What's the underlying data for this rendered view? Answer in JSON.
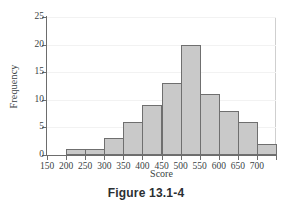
{
  "figure": {
    "caption": "Figure 13.1-4"
  },
  "chart_data": {
    "type": "bar",
    "title": "",
    "xlabel": "Score",
    "ylabel": "Frequency",
    "bin_width": 50,
    "bin_edges": [
      200,
      250,
      300,
      350,
      400,
      450,
      500,
      550,
      600,
      650,
      700,
      750
    ],
    "categories": [
      "200-250",
      "250-300",
      "300-350",
      "350-400",
      "400-450",
      "450-500",
      "500-550",
      "550-600",
      "600-650",
      "650-700",
      "700-750"
    ],
    "values": [
      1,
      1,
      3,
      6,
      9,
      13,
      20,
      11,
      8,
      6,
      2
    ],
    "total_frequency": 80,
    "xlim": [
      150,
      750
    ],
    "ylim": [
      0,
      25
    ],
    "xticks": [
      150,
      200,
      250,
      300,
      350,
      400,
      450,
      500,
      550,
      600,
      650,
      700,
      750
    ],
    "xtick_labels": [
      "150",
      "200",
      "250",
      "300",
      "350",
      "400",
      "450",
      "500",
      "550",
      "600",
      "650",
      "700",
      ""
    ],
    "yticks": [
      0,
      5,
      10,
      15,
      20,
      25
    ],
    "ytick_labels": [
      "0",
      "5",
      "10",
      "15",
      "20",
      "25"
    ],
    "grid": "horizontal-major-faint",
    "legend": "none",
    "bar_fill_color": "#c9c9c9",
    "bar_border_color": "#6f6f6f",
    "axis_color": "#6d6d6d"
  }
}
